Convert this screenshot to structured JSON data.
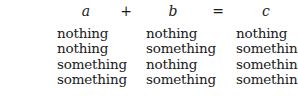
{
  "equation": {
    "a": "a",
    "plus": "+",
    "b": "b",
    "equals": "=",
    "c": "c"
  },
  "rows": [
    {
      "a": "nothing",
      "b": "nothing",
      "c": "nothing"
    },
    {
      "a": "nothing",
      "b": "something",
      "c": "something"
    },
    {
      "a": "something",
      "b": "nothing",
      "c": "something"
    },
    {
      "a": "something",
      "b": "something",
      "c": "something"
    }
  ]
}
